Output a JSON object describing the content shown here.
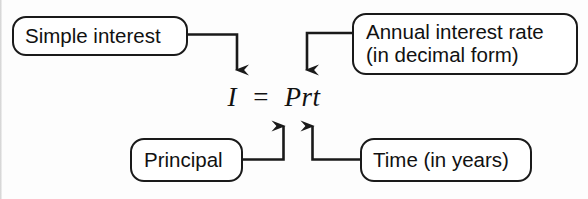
{
  "diagram": {
    "background_color": "#fdfdfd",
    "line_color": "#1a1a1a",
    "text_color": "#111111",
    "formula": "I  =  Prt",
    "nodes": [
      {
        "id": "simple-interest",
        "label": "Simple interest",
        "points_to": "I"
      },
      {
        "id": "annual-rate",
        "label_line1": "Annual interest rate",
        "label_line2": "(in decimal form)",
        "label": "Annual interest rate\n(in decimal form)",
        "points_to": "r"
      },
      {
        "id": "principal",
        "label": "Principal",
        "points_to": "P"
      },
      {
        "id": "time",
        "label": "Time (in years)",
        "points_to": "t"
      }
    ]
  }
}
